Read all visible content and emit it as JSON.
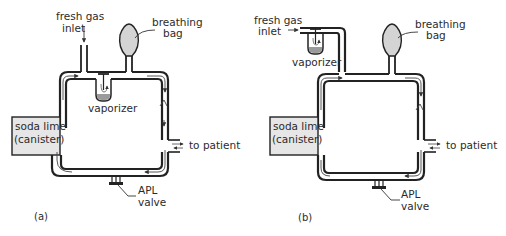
{
  "figure": {
    "panel_a": {
      "caption": "(a)",
      "labels": {
        "fresh_gas_line1": "fresh gas",
        "fresh_gas_line2": "inlet",
        "bag_line1": "breathing",
        "bag_line2": "bag",
        "vaporizer": "vaporizer",
        "soda_line1": "soda lime",
        "soda_line2": "(canister)",
        "patient": "to patient",
        "apl_line1": "APL",
        "apl_line2": "valve"
      }
    },
    "panel_b": {
      "caption": "(b)",
      "labels": {
        "fresh_gas_line1": "fresh gas",
        "fresh_gas_line2": "inlet",
        "bag_line1": "breathing",
        "bag_line2": "bag",
        "vaporizer": "vaporizer",
        "soda_line1": "soda lime",
        "soda_line2": "(canister)",
        "patient": "to patient",
        "apl_line1": "APL",
        "apl_line2": "valve"
      }
    },
    "colors": {
      "line": "#222222",
      "bag_fill": "#d4d4d4",
      "canister_fill": "#e6e6e6",
      "liquid_fill": "#9a9a9a"
    }
  }
}
